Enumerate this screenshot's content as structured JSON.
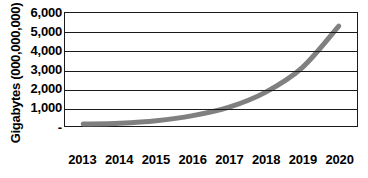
{
  "chart_data": {
    "type": "line",
    "title": "",
    "xlabel": "",
    "ylabel": "Gigabytes (000,000,000)",
    "categories": [
      "2013",
      "2014",
      "2015",
      "2016",
      "2017",
      "2018",
      "2019",
      "2020"
    ],
    "values": [
      100,
      150,
      280,
      550,
      1000,
      1800,
      3100,
      5300
    ],
    "series": [
      {
        "name": "Gigabytes",
        "values": [
          100,
          150,
          280,
          550,
          1000,
          1800,
          3100,
          5300
        ],
        "color": "#808080"
      }
    ],
    "ylim": [
      0,
      6000
    ],
    "ytick_values": [
      6000,
      5000,
      4000,
      3000,
      2000,
      1000,
      0
    ],
    "ytick_labels": [
      "6,000",
      "5,000",
      "4,000",
      "3,000",
      "2,000",
      "1,000",
      "-"
    ],
    "grid": true,
    "legend": false,
    "legend_position": "none",
    "line_color": "#808080",
    "frame_color": "#1a1a1a"
  },
  "axes": {
    "y_title": "Gigabytes (000,000,000)",
    "y_labels": [
      "6,000",
      "5,000",
      "4,000",
      "3,000",
      "2,000",
      "1,000",
      "-"
    ],
    "x_labels": [
      "2013",
      "2014",
      "2015",
      "2016",
      "2017",
      "2018",
      "2019",
      "2020"
    ]
  }
}
